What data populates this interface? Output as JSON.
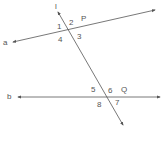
{
  "diagram": {
    "line_color": "#555555",
    "lines": {
      "a": {
        "label": "a",
        "x1": 13,
        "y1": 42,
        "x2": 155,
        "y2": 10
      },
      "b": {
        "label": "b",
        "x1": 18,
        "y1": 97,
        "x2": 160,
        "y2": 97
      },
      "l": {
        "label": "l",
        "x1": 58,
        "y1": 12,
        "x2": 123,
        "y2": 125
      }
    },
    "points": {
      "P": {
        "label": "P"
      },
      "Q": {
        "label": "Q"
      }
    },
    "angles": {
      "a1": "1",
      "a2": "2",
      "a3": "3",
      "a4": "4",
      "a5": "5",
      "a6": "6",
      "a7": "7",
      "a8": "8"
    }
  }
}
